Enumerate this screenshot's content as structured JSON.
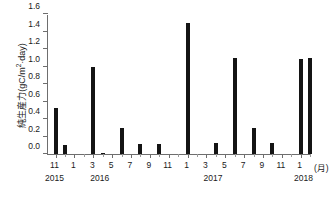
{
  "chart_data": {
    "type": "bar",
    "title": "",
    "xlabel": "(月)",
    "ylabel": "純生産力(gC/m²·day)",
    "ylabel_main": "純生産力(gC/m",
    "ylabel_sup": "2",
    "ylabel_tail": "·day)",
    "ylim": [
      0,
      1.6
    ],
    "ytick_labels": [
      "0.0",
      "0.2",
      "0.4",
      "0.6",
      "0.8",
      "1.0",
      "1.2",
      "1.4",
      "1.6"
    ],
    "ytick_values": [
      0.0,
      0.2,
      0.4,
      0.6,
      0.8,
      1.0,
      1.2,
      1.4,
      1.6
    ],
    "grid": false,
    "legend": "none",
    "bar_color": "#141414",
    "axis_color": "#6e6e6e",
    "x_month_labels": [
      "11",
      "1",
      "3",
      "5",
      "7",
      "9",
      "11",
      "1",
      "3",
      "5",
      "7",
      "9",
      "11",
      "1"
    ],
    "x_month_positions": [
      11,
      13,
      15,
      17,
      19,
      21,
      23,
      25,
      27,
      29,
      31,
      33,
      35,
      37
    ],
    "x_year_labels": [
      "2015",
      "2016",
      "2017",
      "2018"
    ],
    "x_year_positions": [
      11,
      15.8,
      27.8,
      37.4
    ],
    "x_unit_label": "(月)",
    "x_unit_position": 39.3,
    "x_range": [
      10.2,
      38.2
    ],
    "categories": [
      "2015-11",
      "2015-12",
      "2016-01",
      "2016-02",
      "2016-03",
      "2016-04",
      "2016-05",
      "2016-06",
      "2016-07",
      "2016-08",
      "2016-09",
      "2016-10",
      "2016-11",
      "2016-12",
      "2017-01",
      "2017-02",
      "2017-03",
      "2017-04",
      "2017-05",
      "2017-06",
      "2017-07",
      "2017-08",
      "2017-09",
      "2017-10",
      "2017-11",
      "2017-12",
      "2018-01",
      "2018-02"
    ],
    "x_numeric": [
      11,
      12,
      13,
      14,
      15,
      16,
      17,
      18,
      19,
      20,
      21,
      22,
      23,
      24,
      25,
      26,
      27,
      28,
      29,
      30,
      31,
      32,
      33,
      34,
      35,
      36,
      37,
      38
    ],
    "values": [
      0.53,
      0.1,
      0.0,
      0.0,
      1.0,
      0.01,
      0.0,
      0.3,
      0.0,
      0.11,
      0.0,
      0.11,
      0.0,
      0.0,
      1.5,
      0.0,
      0.0,
      0.13,
      0.0,
      1.1,
      0.0,
      0.3,
      0.0,
      0.13,
      0.0,
      0.0,
      1.09,
      1.1
    ]
  }
}
